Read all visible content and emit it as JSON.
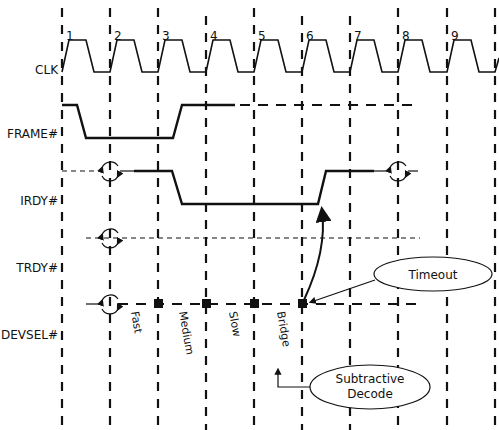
{
  "diagram": {
    "type": "timing-diagram",
    "clock_cycles": [
      "1",
      "2",
      "3",
      "4",
      "5",
      "6",
      "7",
      "8",
      "9"
    ],
    "signals": [
      {
        "name": "CLK"
      },
      {
        "name": "FRAME#"
      },
      {
        "name": "IRDY#"
      },
      {
        "name": "TRDY#"
      },
      {
        "name": "DEVSEL#"
      }
    ],
    "devsel_timing_labels": {
      "fast": "Fast",
      "medium": "Medium",
      "slow": "Slow",
      "bridge": "Bridge"
    },
    "callouts": {
      "timeout": "Timeout",
      "subtractive_line1": "Subtractive",
      "subtractive_line2": "Decode"
    }
  }
}
